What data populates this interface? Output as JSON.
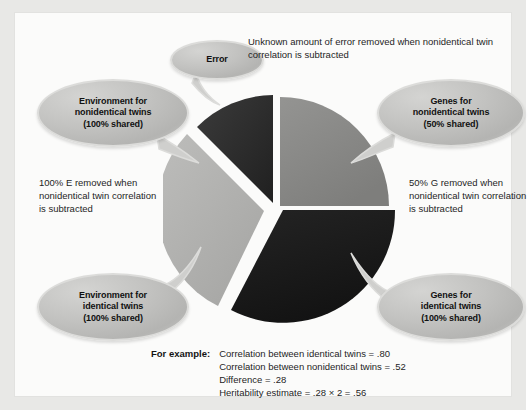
{
  "figure": {
    "title_hidden": "Heritability estimate from twin correlations",
    "background_color": "#e8e8e6",
    "panel_color": "#fbfbfa"
  },
  "chart_data": {
    "type": "pie",
    "title": "",
    "xlabel": "",
    "ylabel": "",
    "legend_position": "callout-bubbles",
    "exploded": true,
    "categories": [
      "Error",
      "Genes for nonidentical twins (50% shared)",
      "Genes for identical twins (100% shared)",
      "Environment for identical twins (100% shared)",
      "Environment for nonidentical twins (100% shared)"
    ],
    "slices": [
      {
        "label": "Error",
        "share_deg": 54,
        "color": "#2b2b2b",
        "exploded": true
      },
      {
        "label": "Genes for nonidentical twins (50% shared)",
        "share_deg": 82,
        "color": "#8a8a88",
        "exploded": false
      },
      {
        "label": "Genes for identical twins (100% shared)",
        "share_deg": 110,
        "color": "#1c1c1c",
        "exploded": false
      },
      {
        "label": "Environment (shared)",
        "share_deg": 108,
        "color": "#b0b0ae",
        "exploded": true
      }
    ],
    "colors": [
      "#2b2b2b",
      "#8a8a88",
      "#1c1c1c",
      "#b0b0ae"
    ]
  },
  "bubbles": {
    "error": {
      "lines": [
        "Error"
      ]
    },
    "environment_nonidentical": {
      "lines": [
        "Environment for",
        "nonidentical twins",
        "(100% shared)"
      ]
    },
    "genes_nonidentical": {
      "lines": [
        "Genes for",
        "nonidentical twins",
        "(50% shared)"
      ]
    },
    "environment_identical": {
      "lines": [
        "Environment for",
        "identical twins",
        "(100% shared)"
      ]
    },
    "genes_identical": {
      "lines": [
        "Genes for",
        "identical twins",
        "(100% shared)"
      ]
    }
  },
  "annotations": {
    "top": "Unknown amount of error removed when nonidentical twin correlation is subtracted",
    "left": "100% E  removed when nonidentical twin correlation is subtracted",
    "right": "50% G removed when nonidentical twin correlation is subtracted"
  },
  "example": {
    "label": "For example:",
    "lines": [
      "Correlation between identical twins = .80",
      "Correlation between nonidentical twins = .52",
      "Difference = .28",
      "Heritability estimate = .28 × 2 = .56"
    ]
  }
}
